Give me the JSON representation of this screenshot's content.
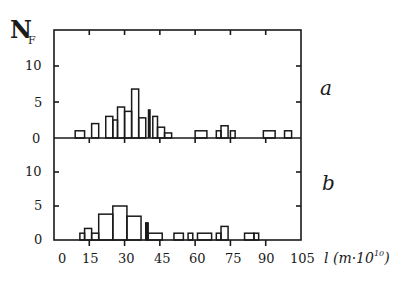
{
  "chart_data": [
    {
      "type": "bar",
      "panel": "a",
      "subtitle": "a",
      "xlabel": "l (m·10^10)",
      "ylabel": "N_F",
      "xlim": [
        0,
        105
      ],
      "ylim": [
        0,
        15
      ],
      "yticks": [
        "0",
        "5",
        "10"
      ],
      "xticks": [
        "0",
        "15",
        "30",
        "45",
        "60",
        "75",
        "90",
        "105"
      ],
      "grid": false,
      "histogram": true,
      "bins": [
        {
          "x0": 9,
          "x1": 13,
          "value": 1
        },
        {
          "x0": 16,
          "x1": 19,
          "value": 2
        },
        {
          "x0": 22,
          "x1": 25,
          "value": 3
        },
        {
          "x0": 25,
          "x1": 27,
          "value": 2.5
        },
        {
          "x0": 27,
          "x1": 30,
          "value": 4.3
        },
        {
          "x0": 30,
          "x1": 33,
          "value": 3.7
        },
        {
          "x0": 33,
          "x1": 36,
          "value": 6.8
        },
        {
          "x0": 36,
          "x1": 39,
          "value": 2.8
        },
        {
          "x0": 42,
          "x1": 44,
          "value": 3
        },
        {
          "x0": 44,
          "x1": 47,
          "value": 1.5
        },
        {
          "x0": 47,
          "x1": 50,
          "value": 0.7
        },
        {
          "x0": 60,
          "x1": 65,
          "value": 1
        },
        {
          "x0": 69,
          "x1": 71,
          "value": 1
        },
        {
          "x0": 71,
          "x1": 74,
          "value": 1.7
        },
        {
          "x0": 75,
          "x1": 77,
          "value": 1
        },
        {
          "x0": 89,
          "x1": 94,
          "value": 1
        },
        {
          "x0": 98,
          "x1": 101,
          "value": 1
        }
      ],
      "markers": [
        {
          "x": 40.5,
          "label": "arrow"
        }
      ]
    },
    {
      "type": "bar",
      "panel": "b",
      "subtitle": "b",
      "xlabel": "l (m·10^10)",
      "ylabel": "N_F",
      "xlim": [
        0,
        105
      ],
      "ylim": [
        0,
        15
      ],
      "yticks": [
        "0",
        "5",
        "10"
      ],
      "xticks": [
        "0",
        "15",
        "30",
        "45",
        "60",
        "75",
        "90",
        "105"
      ],
      "grid": false,
      "histogram": true,
      "bins": [
        {
          "x0": 11,
          "x1": 13,
          "value": 1
        },
        {
          "x0": 13,
          "x1": 16,
          "value": 1.7
        },
        {
          "x0": 16,
          "x1": 19,
          "value": 1
        },
        {
          "x0": 19,
          "x1": 25,
          "value": 3.8
        },
        {
          "x0": 25,
          "x1": 31,
          "value": 5
        },
        {
          "x0": 31,
          "x1": 37,
          "value": 3.5
        },
        {
          "x0": 39,
          "x1": 40,
          "value": 2.5
        },
        {
          "x0": 40,
          "x1": 46,
          "value": 1
        },
        {
          "x0": 51,
          "x1": 55,
          "value": 1
        },
        {
          "x0": 57,
          "x1": 59,
          "value": 1
        },
        {
          "x0": 61,
          "x1": 67,
          "value": 1
        },
        {
          "x0": 69,
          "x1": 71,
          "value": 1
        },
        {
          "x0": 71,
          "x1": 74,
          "value": 2
        },
        {
          "x0": 81,
          "x1": 85,
          "value": 1
        },
        {
          "x0": 85,
          "x1": 87,
          "value": 1
        }
      ]
    }
  ],
  "labels": {
    "ylabel_main": "N",
    "ylabel_sub": "F",
    "xlabel_main": "l (m·10",
    "xlabel_sup": "10",
    "xlabel_close": ")",
    "panel_a": "a",
    "panel_b": "b",
    "yticks": [
      "0",
      "5",
      "10"
    ],
    "xticks": [
      "0",
      "15",
      "30",
      "45",
      "60",
      "75",
      "90",
      "105"
    ]
  }
}
